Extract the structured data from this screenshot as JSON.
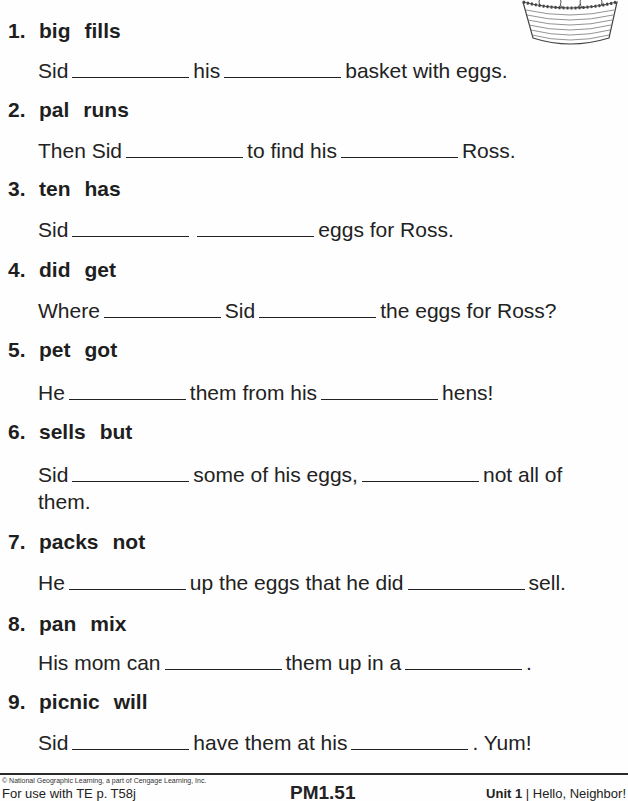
{
  "worksheet": {
    "items": [
      {
        "number": "1.",
        "words": [
          "big",
          "fills"
        ],
        "parts": [
          "Sid",
          "his",
          "basket with eggs."
        ]
      },
      {
        "number": "2.",
        "words": [
          "pal",
          "runs"
        ],
        "parts": [
          "Then Sid",
          "to find his",
          "Ross."
        ]
      },
      {
        "number": "3.",
        "words": [
          "ten",
          "has"
        ],
        "parts": [
          "Sid",
          "",
          "eggs for Ross."
        ]
      },
      {
        "number": "4.",
        "words": [
          "did",
          "get"
        ],
        "parts": [
          "Where",
          "Sid",
          "the eggs for Ross?"
        ]
      },
      {
        "number": "5.",
        "words": [
          "pet",
          "got"
        ],
        "parts": [
          "He",
          "them from his",
          "hens!"
        ]
      },
      {
        "number": "6.",
        "words": [
          "sells",
          "but"
        ],
        "parts": [
          "Sid",
          "some of his eggs,",
          "not all of"
        ],
        "continuation": "them."
      },
      {
        "number": "7.",
        "words": [
          "packs",
          "not"
        ],
        "parts": [
          "He",
          "up the eggs that he did",
          "sell."
        ]
      },
      {
        "number": "8.",
        "words": [
          "pan",
          "mix"
        ],
        "parts": [
          "His mom can",
          "them up in a",
          "."
        ]
      },
      {
        "number": "9.",
        "words": [
          "picnic",
          "will"
        ],
        "parts": [
          "Sid",
          "have them at his",
          ". Yum!"
        ]
      }
    ],
    "illustration": "egg-basket-icon"
  },
  "footer": {
    "copyright": "© National Geographic Learning, a part of Cengage Learning, Inc.",
    "te_reference": "For use with TE p. T58j",
    "page_code": "PM1.51",
    "unit_label": "Unit 1",
    "unit_separator": " | ",
    "unit_title": "Hello, Neighbor!"
  }
}
